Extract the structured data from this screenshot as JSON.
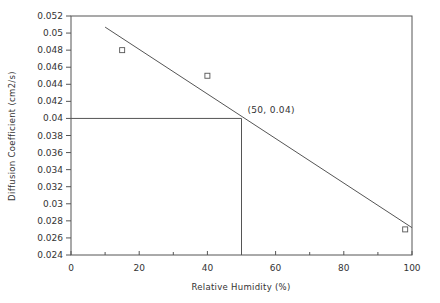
{
  "chart_data": {
    "type": "scatter",
    "title": "",
    "xlabel": "Relative Humidity  (%)",
    "ylabel": "Diffusion Coefficient  (cm2/s)",
    "xlim": [
      0,
      100
    ],
    "ylim": [
      0.024,
      0.052
    ],
    "x_ticks": [
      0,
      20,
      40,
      60,
      80,
      100
    ],
    "x_tick_labels": [
      "0",
      "20",
      "40",
      "60",
      "80",
      "100"
    ],
    "x_minor_ticks": [
      10,
      30,
      50,
      70,
      90
    ],
    "y_ticks": [
      0.024,
      0.026,
      0.028,
      0.03,
      0.032,
      0.034,
      0.036,
      0.038,
      0.04,
      0.042,
      0.044,
      0.046,
      0.048,
      0.05,
      0.052
    ],
    "y_tick_labels": [
      "0.024",
      "0.026",
      "0.028",
      "0.03",
      "0.032",
      "0.034",
      "0.036",
      "0.038",
      "0.04",
      "0.042",
      "0.044",
      "0.046",
      "0.048",
      "0.05",
      "0.052"
    ],
    "grid": false,
    "legend": null,
    "series": [
      {
        "name": "measured",
        "marker": "open-square",
        "points": [
          {
            "x": 15,
            "y": 0.048
          },
          {
            "x": 40,
            "y": 0.045
          },
          {
            "x": 98,
            "y": 0.027
          }
        ]
      },
      {
        "name": "fit-line",
        "style": "line",
        "points": [
          {
            "x": 10,
            "y": 0.0507
          },
          {
            "x": 100,
            "y": 0.0272
          }
        ]
      }
    ],
    "reference_lines": [
      {
        "orientation": "horizontal",
        "y": 0.04,
        "x_from": 0,
        "x_to": 50
      },
      {
        "orientation": "vertical",
        "x": 50,
        "y_from": 0.024,
        "y_to": 0.04
      }
    ],
    "annotations": [
      {
        "text": "(50, 0.04)",
        "x": 50,
        "y": 0.04
      }
    ]
  },
  "colors": {
    "axis": "#555555",
    "line": "#555555",
    "marker": "#555555",
    "text": "#333333",
    "background": "#ffffff"
  }
}
